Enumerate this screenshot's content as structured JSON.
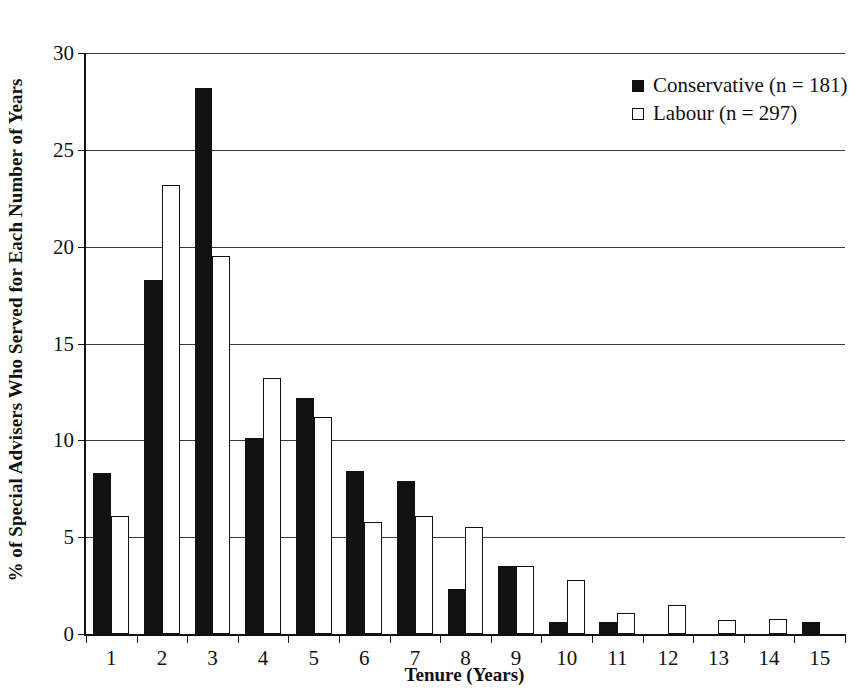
{
  "chart_data": {
    "type": "bar",
    "title": "",
    "xlabel": "Tenure (Years)",
    "ylabel": "% of Special Advisers Who Served for Each Number of Years",
    "categories": [
      "1",
      "2",
      "3",
      "4",
      "5",
      "6",
      "7",
      "8",
      "9",
      "10",
      "11",
      "12",
      "13",
      "14",
      "15"
    ],
    "series": [
      {
        "name": "Conservative (n = 181)",
        "color": "#111111",
        "style": "filled",
        "values": [
          8.3,
          18.3,
          28.2,
          10.1,
          12.2,
          8.4,
          7.9,
          2.3,
          3.5,
          0.6,
          0.6,
          0,
          0,
          0,
          0.6
        ]
      },
      {
        "name": "Labour (n = 297)",
        "color": "#ffffff",
        "style": "hollow",
        "values": [
          6.1,
          23.2,
          19.5,
          13.2,
          11.2,
          5.8,
          6.1,
          5.5,
          3.5,
          2.8,
          1.1,
          1.5,
          0.7,
          0.8,
          0
        ]
      }
    ],
    "ylim": [
      0,
      30
    ],
    "yticks": [
      0,
      5,
      10,
      15,
      20,
      25,
      30
    ],
    "ytick_labels": [
      "0",
      "5",
      "10",
      "15",
      "20",
      "25",
      "30"
    ],
    "grid": true,
    "legend_position": "top-right"
  },
  "legend": {
    "items": [
      {
        "label": "Conservative (n = 181)",
        "swatch": "filled-square-icon"
      },
      {
        "label": "Labour (n = 297)",
        "swatch": "hollow-square-icon"
      }
    ]
  },
  "axes": {
    "x_title": "Tenure (Years)",
    "y_title": "% of Special Advisers Who Served for Each Number of Years"
  }
}
